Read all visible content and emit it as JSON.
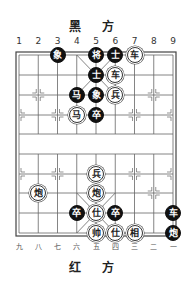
{
  "board": {
    "top_side_label": "黑 方",
    "bottom_side_label": "红 方",
    "top_column_labels": [
      "1",
      "2",
      "3",
      "4",
      "5",
      "6",
      "7",
      "8",
      "9"
    ],
    "bottom_column_labels": [
      "九",
      "八",
      "七",
      "六",
      "五",
      "四",
      "三",
      "二",
      "一"
    ],
    "colors": {
      "black_piece": "#111111",
      "red_piece_fill": "#ffffff",
      "grid": "#555555"
    },
    "pieces": [
      {
        "side": "black",
        "char": "象",
        "col": 3,
        "row": 0
      },
      {
        "side": "black",
        "char": "将",
        "col": 5,
        "row": 0
      },
      {
        "side": "black",
        "char": "士",
        "col": 6,
        "row": 0
      },
      {
        "side": "red",
        "char": "车",
        "col": 7,
        "row": 0
      },
      {
        "side": "black",
        "char": "士",
        "col": 5,
        "row": 1
      },
      {
        "side": "red",
        "char": "车",
        "col": 6,
        "row": 1
      },
      {
        "side": "black",
        "char": "马",
        "col": 4,
        "row": 2
      },
      {
        "side": "black",
        "char": "象",
        "col": 5,
        "row": 2
      },
      {
        "side": "red",
        "char": "兵",
        "col": 6,
        "row": 2
      },
      {
        "side": "red",
        "char": "马",
        "col": 4,
        "row": 3
      },
      {
        "side": "black",
        "char": "卒",
        "col": 5,
        "row": 3
      },
      {
        "side": "red",
        "char": "兵",
        "col": 5,
        "row": 6
      },
      {
        "side": "red",
        "char": "炮",
        "col": 2,
        "row": 7
      },
      {
        "side": "red",
        "char": "炮",
        "col": 5,
        "row": 7
      },
      {
        "side": "black",
        "char": "卒",
        "col": 4,
        "row": 8
      },
      {
        "side": "red",
        "char": "仕",
        "col": 5,
        "row": 8
      },
      {
        "side": "black",
        "char": "卒",
        "col": 6,
        "row": 8
      },
      {
        "side": "black",
        "char": "车",
        "col": 9,
        "row": 8
      },
      {
        "side": "red",
        "char": "帅",
        "col": 5,
        "row": 9
      },
      {
        "side": "red",
        "char": "仕",
        "col": 6,
        "row": 9
      },
      {
        "side": "red",
        "char": "相",
        "col": 7,
        "row": 9
      },
      {
        "side": "black",
        "char": "炮",
        "col": 9,
        "row": 9
      }
    ]
  }
}
